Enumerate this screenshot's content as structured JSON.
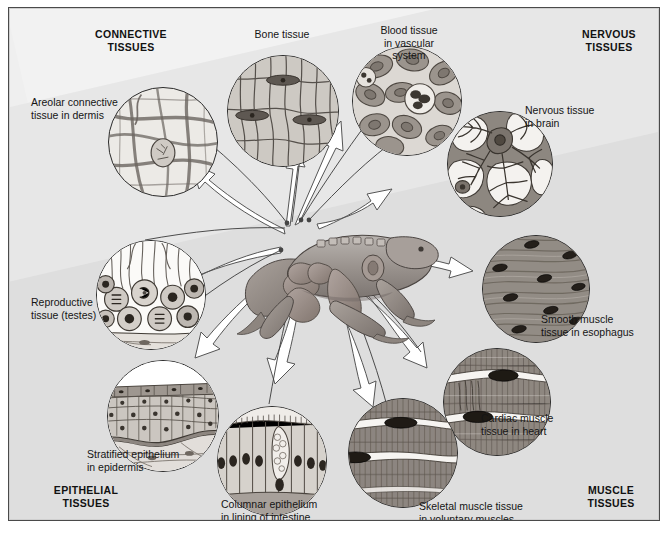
{
  "figure": {
    "background_color": "#e2e2e2",
    "frame_color": "#4a4a4a",
    "ink_color": "#2b2b2b",
    "arrow_fill": "#ffffff"
  },
  "sections": [
    {
      "id": "connective",
      "label": "CONNECTIVE\nTISSUES",
      "corner": "top-left"
    },
    {
      "id": "nervous",
      "label": "NERVOUS\nTISSUES",
      "corner": "top-right"
    },
    {
      "id": "epithelial",
      "label": "EPITHELIAL\nTISSUES",
      "corner": "bottom-left"
    },
    {
      "id": "muscle",
      "label": "MUSCLE\nTISSUES",
      "corner": "bottom-right"
    }
  ],
  "tissues": [
    {
      "id": "areolar",
      "label": "Areolar connective\ntissue in dermis",
      "group": "connective",
      "pattern": "fibers"
    },
    {
      "id": "bone",
      "label": "Bone tissue",
      "group": "connective",
      "pattern": "bone"
    },
    {
      "id": "blood",
      "label": "Blood tissue\nin vascular\nsystem",
      "group": "connective",
      "pattern": "blood"
    },
    {
      "id": "nervous",
      "label": "Nervous tissue\nin brain",
      "group": "nervous",
      "pattern": "neuron"
    },
    {
      "id": "smooth",
      "label": "Smooth muscle\ntissue in esophagus",
      "group": "muscle",
      "pattern": "smooth"
    },
    {
      "id": "cardiac",
      "label": "Cardiac muscle\ntissue in heart",
      "group": "muscle",
      "pattern": "striated"
    },
    {
      "id": "skeletal",
      "label": "Skeletal muscle tissue\nin voluntary muscles",
      "group": "muscle",
      "pattern": "striated"
    },
    {
      "id": "columnar",
      "label": "Columnar epithelium\nin lining of intestine",
      "group": "epithelial",
      "pattern": "columnar"
    },
    {
      "id": "stratified",
      "label": "Stratified epithelium\nin epidermis",
      "group": "epithelial",
      "pattern": "stratified"
    },
    {
      "id": "reproductive",
      "label": "Reproductive\ntissue (testes)",
      "group": "connective",
      "pattern": "germ"
    }
  ],
  "center": {
    "subject": "dissected frog",
    "id": "frog-illustration"
  }
}
